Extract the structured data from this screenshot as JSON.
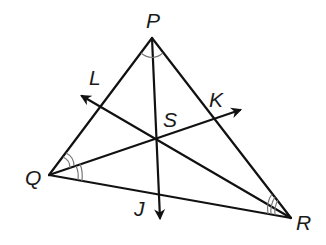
{
  "diagram": {
    "type": "triangle-angle-bisectors",
    "vertices": {
      "P": "P",
      "Q": "Q",
      "R": "R"
    },
    "incenter": "S",
    "rays": {
      "L": "L",
      "K": "K",
      "J": "J"
    },
    "angle_marks": {
      "P": "single arc",
      "Q": "double arc",
      "R": "triple arc"
    },
    "stroke_color": "#111111",
    "arc_color": "#777777"
  }
}
